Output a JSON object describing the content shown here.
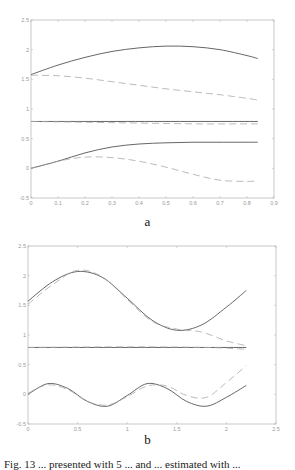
{
  "chart_data": [
    {
      "id": "a",
      "type": "line",
      "panel_label": "a",
      "title": "",
      "xlabel": "",
      "ylabel": "",
      "xlim": [
        0,
        0.9
      ],
      "ylim": [
        -0.5,
        2.5
      ],
      "xticks": [
        "0",
        "0.1",
        "0.2",
        "0.3",
        "0.4",
        "0.5",
        "0.6",
        "0.7",
        "0.8",
        "0.9"
      ],
      "yticks": [
        "-0.5",
        "0",
        "0.5",
        "1",
        "1.5",
        "2",
        "2.5"
      ],
      "grid": false,
      "legend": null,
      "series": [
        {
          "name": "upper-solid",
          "style": "solid",
          "color": "#555555",
          "x": [
            0,
            0.1,
            0.2,
            0.3,
            0.4,
            0.5,
            0.6,
            0.7,
            0.8,
            0.84
          ],
          "y": [
            1.58,
            1.74,
            1.87,
            1.97,
            2.03,
            2.06,
            2.05,
            2.0,
            1.9,
            1.85
          ]
        },
        {
          "name": "upper-dashed",
          "style": "dashed",
          "color": "#aaaaaa",
          "x": [
            0,
            0.1,
            0.2,
            0.3,
            0.4,
            0.5,
            0.6,
            0.7,
            0.8,
            0.84
          ],
          "y": [
            1.57,
            1.56,
            1.52,
            1.46,
            1.4,
            1.34,
            1.29,
            1.24,
            1.18,
            1.15
          ]
        },
        {
          "name": "middle-solid",
          "style": "solid",
          "color": "#555555",
          "x": [
            0,
            0.84
          ],
          "y": [
            0.79,
            0.79
          ]
        },
        {
          "name": "middle-dashed",
          "style": "dashed",
          "color": "#aaaaaa",
          "x": [
            0,
            0.3,
            0.6,
            0.84
          ],
          "y": [
            0.79,
            0.77,
            0.75,
            0.75
          ]
        },
        {
          "name": "lower-solid",
          "style": "solid",
          "color": "#555555",
          "x": [
            0,
            0.1,
            0.2,
            0.3,
            0.4,
            0.5,
            0.6,
            0.7,
            0.8,
            0.84
          ],
          "y": [
            0.0,
            0.12,
            0.26,
            0.36,
            0.41,
            0.43,
            0.44,
            0.44,
            0.44,
            0.44
          ]
        },
        {
          "name": "lower-dashed",
          "style": "dashed",
          "color": "#aaaaaa",
          "x": [
            0,
            0.1,
            0.2,
            0.3,
            0.4,
            0.5,
            0.6,
            0.7,
            0.8,
            0.84
          ],
          "y": [
            0.0,
            0.12,
            0.19,
            0.18,
            0.12,
            0.02,
            -0.1,
            -0.2,
            -0.22,
            -0.21
          ]
        }
      ]
    },
    {
      "id": "b",
      "type": "line",
      "panel_label": "b",
      "title": "",
      "xlabel": "",
      "ylabel": "",
      "xlim": [
        0,
        2.5
      ],
      "ylim": [
        -0.5,
        2.5
      ],
      "xticks": [
        "0",
        "0.5",
        "1",
        "1.5",
        "2",
        "2.5"
      ],
      "yticks": [
        "-0.5",
        "0",
        "0.5",
        "1",
        "1.5",
        "2",
        "2.5"
      ],
      "grid": false,
      "legend": null,
      "series": [
        {
          "name": "upper-solid",
          "style": "solid",
          "color": "#555555",
          "x": [
            0,
            0.25,
            0.5,
            0.75,
            1.0,
            1.25,
            1.5,
            1.75,
            2.0,
            2.2
          ],
          "y": [
            1.57,
            1.9,
            2.07,
            1.97,
            1.62,
            1.25,
            1.08,
            1.17,
            1.47,
            1.75
          ]
        },
        {
          "name": "upper-dashed",
          "style": "dashed",
          "color": "#aaaaaa",
          "x": [
            0,
            0.25,
            0.5,
            0.75,
            1.0,
            1.25,
            1.5,
            1.75,
            2.0,
            2.2
          ],
          "y": [
            1.52,
            1.85,
            2.09,
            1.98,
            1.6,
            1.23,
            1.1,
            1.05,
            0.9,
            0.82
          ]
        },
        {
          "name": "middle-solid",
          "style": "solid",
          "color": "#555555",
          "x": [
            0,
            2.2
          ],
          "y": [
            0.79,
            0.79
          ]
        },
        {
          "name": "middle-dashed",
          "style": "dashed",
          "color": "#aaaaaa",
          "x": [
            0,
            1.0,
            1.8,
            2.2
          ],
          "y": [
            0.79,
            0.8,
            0.79,
            0.76
          ]
        },
        {
          "name": "lower-solid",
          "style": "solid",
          "color": "#555555",
          "x": [
            0,
            0.2,
            0.4,
            0.6,
            0.8,
            1.0,
            1.2,
            1.4,
            1.6,
            1.8,
            2.0,
            2.2
          ],
          "y": [
            0.0,
            0.18,
            0.1,
            -0.12,
            -0.2,
            -0.02,
            0.18,
            0.1,
            -0.12,
            -0.2,
            -0.05,
            0.15
          ]
        },
        {
          "name": "lower-dashed",
          "style": "dashed",
          "color": "#aaaaaa",
          "x": [
            0,
            0.2,
            0.4,
            0.6,
            0.8,
            1.0,
            1.2,
            1.4,
            1.6,
            1.8,
            2.0,
            2.2
          ],
          "y": [
            0.02,
            0.16,
            0.08,
            -0.12,
            -0.18,
            -0.04,
            0.14,
            0.14,
            -0.02,
            -0.05,
            0.2,
            0.48
          ]
        }
      ]
    }
  ],
  "figure": {
    "panel_a_label": "a",
    "panel_b_label": "b",
    "caption_fragment": "Fig. 13 ... presented with 5 ... and ... estimated with ..."
  }
}
